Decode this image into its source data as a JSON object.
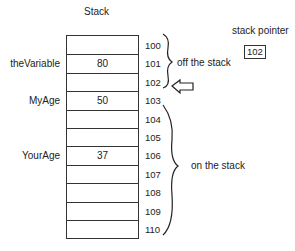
{
  "title": "Stack",
  "stack_pointer": {
    "label": "stack pointer",
    "value": "102"
  },
  "rows": [
    {
      "address": "100",
      "variable": "",
      "value": ""
    },
    {
      "address": "101",
      "variable": "theVariable",
      "value": "80"
    },
    {
      "address": "102",
      "variable": "",
      "value": ""
    },
    {
      "address": "103",
      "variable": "MyAge",
      "value": "50"
    },
    {
      "address": "104",
      "variable": "",
      "value": ""
    },
    {
      "address": "105",
      "variable": "",
      "value": ""
    },
    {
      "address": "106",
      "variable": "YourAge",
      "value": "37"
    },
    {
      "address": "107",
      "variable": "",
      "value": ""
    },
    {
      "address": "108",
      "variable": "",
      "value": ""
    },
    {
      "address": "109",
      "variable": "",
      "value": ""
    },
    {
      "address": "110",
      "variable": "",
      "value": ""
    }
  ],
  "annotations": {
    "off_stack": "off the stack",
    "on_stack": "on the stack"
  }
}
